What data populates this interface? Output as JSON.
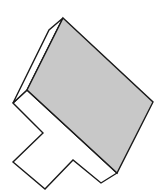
{
  "diagram": {
    "type": "3d-solid",
    "colors": {
      "background": "#ffffff",
      "top_face": "#c8c8c8",
      "side_face": "#ffffff",
      "stroke": "#1a1a1a"
    },
    "faces": {
      "top_face": {
        "points": "63,18 153,102 117,173 27,90"
      },
      "left_bevel_face": {
        "points": "63,18 49,30 13,103 27,90"
      },
      "base_face": {
        "points": "27,90 13,103 43,133 13,162 45,189 73,160 101,183 117,173"
      }
    },
    "edges": {
      "bevel_inner": "49,30 27,90"
    }
  }
}
